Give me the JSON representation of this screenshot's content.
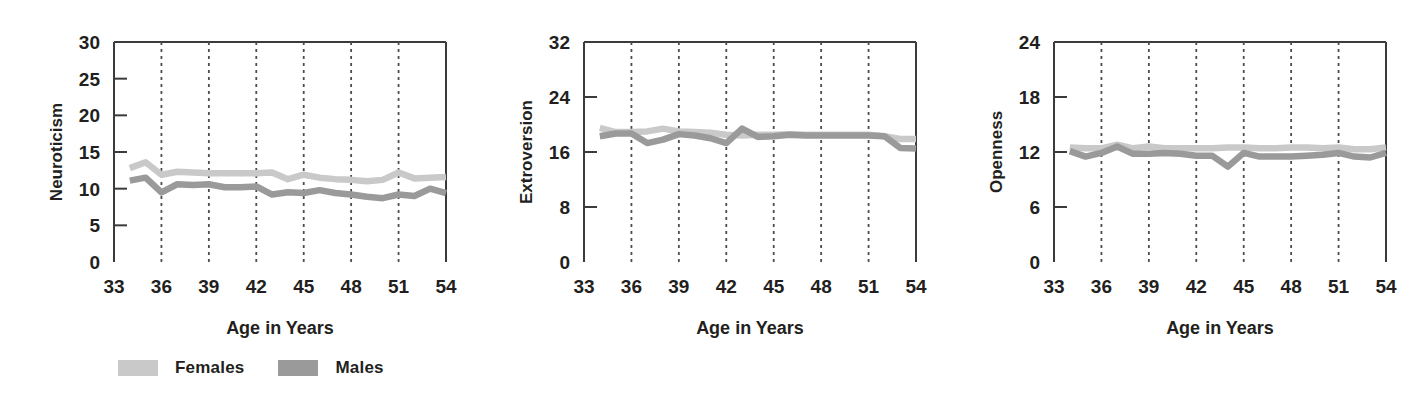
{
  "figure": {
    "series_colors": {
      "females": "#c9c9c9",
      "males": "#9a9a9a"
    },
    "axis_color": "#3b3b3b",
    "grid_color": "#4d4d4d"
  },
  "legend": {
    "entries": [
      {
        "label": "Females",
        "color": "#c9c9c9",
        "swatch_name": "legend-swatch-females"
      },
      {
        "label": "Males",
        "color": "#9a9a9a",
        "swatch_name": "legend-swatch-males"
      }
    ]
  },
  "chart_data": [
    {
      "type": "line",
      "title": "",
      "xlabel": "Age in Years",
      "ylabel": "Neuroticism",
      "xlim": [
        33,
        54
      ],
      "ylim": [
        0,
        30
      ],
      "xticks": [
        33,
        36,
        39,
        42,
        45,
        48,
        51,
        54
      ],
      "yticks": [
        0,
        5,
        10,
        15,
        20,
        25,
        30
      ],
      "grid": "vertical-dashed",
      "legend_position": "below-figure",
      "x": [
        34,
        35,
        36,
        37,
        38,
        39,
        40,
        41,
        42,
        43,
        44,
        45,
        46,
        47,
        48,
        49,
        50,
        51,
        52,
        53,
        54
      ],
      "series": [
        {
          "name": "Females",
          "color": "#c9c9c9",
          "values": [
            12.8,
            13.6,
            11.9,
            12.3,
            12.2,
            12.1,
            12.1,
            12.1,
            12.1,
            12.2,
            11.3,
            11.9,
            11.5,
            11.3,
            11.2,
            11.0,
            11.2,
            12.2,
            11.4,
            11.5,
            11.6
          ]
        },
        {
          "name": "Males",
          "color": "#9a9a9a",
          "values": [
            11.1,
            11.5,
            9.5,
            10.6,
            10.5,
            10.6,
            10.2,
            10.2,
            10.3,
            9.2,
            9.5,
            9.4,
            9.8,
            9.4,
            9.2,
            8.9,
            8.7,
            9.2,
            9.0,
            10.0,
            9.4
          ]
        }
      ]
    },
    {
      "type": "line",
      "title": "",
      "xlabel": "Age in Years",
      "ylabel": "Extroversion",
      "xlim": [
        33,
        54
      ],
      "ylim": [
        0,
        32
      ],
      "xticks": [
        33,
        36,
        39,
        42,
        45,
        48,
        51,
        54
      ],
      "yticks": [
        0,
        8,
        16,
        24,
        32
      ],
      "grid": "vertical-dashed",
      "legend_position": "below-figure",
      "x": [
        34,
        35,
        36,
        37,
        38,
        39,
        40,
        41,
        42,
        43,
        44,
        45,
        46,
        47,
        48,
        49,
        50,
        51,
        52,
        53,
        54
      ],
      "series": [
        {
          "name": "Females",
          "color": "#c9c9c9",
          "values": [
            19.5,
            18.9,
            18.9,
            19.0,
            19.4,
            19.0,
            18.9,
            18.8,
            18.5,
            18.4,
            18.5,
            18.5,
            18.6,
            18.5,
            18.5,
            18.5,
            18.5,
            18.5,
            18.3,
            17.9,
            17.9
          ]
        },
        {
          "name": "Males",
          "color": "#9a9a9a",
          "values": [
            18.3,
            18.7,
            18.7,
            17.3,
            17.8,
            18.6,
            18.4,
            18.0,
            17.3,
            19.4,
            18.2,
            18.3,
            18.5,
            18.4,
            18.4,
            18.4,
            18.4,
            18.4,
            18.3,
            16.6,
            16.5
          ]
        }
      ]
    },
    {
      "type": "line",
      "title": "",
      "xlabel": "Age in Years",
      "ylabel": "Openness",
      "xlim": [
        33,
        54
      ],
      "ylim": [
        0,
        24
      ],
      "xticks": [
        33,
        36,
        39,
        42,
        45,
        48,
        51,
        54
      ],
      "yticks": [
        0,
        6,
        12,
        18,
        24
      ],
      "grid": "vertical-dashed",
      "legend_position": "below-figure",
      "x": [
        34,
        35,
        36,
        37,
        38,
        39,
        40,
        41,
        42,
        43,
        44,
        45,
        46,
        47,
        48,
        49,
        50,
        51,
        52,
        53,
        54
      ],
      "series": [
        {
          "name": "Females",
          "color": "#c9c9c9",
          "values": [
            12.5,
            12.4,
            12.4,
            12.8,
            12.4,
            12.6,
            12.4,
            12.4,
            12.4,
            12.4,
            12.5,
            12.5,
            12.4,
            12.4,
            12.5,
            12.5,
            12.4,
            12.5,
            12.3,
            12.3,
            12.5
          ]
        },
        {
          "name": "Males",
          "color": "#9a9a9a",
          "values": [
            12.1,
            11.5,
            11.9,
            12.6,
            11.8,
            11.8,
            11.9,
            11.8,
            11.6,
            11.6,
            10.4,
            11.9,
            11.5,
            11.5,
            11.5,
            11.6,
            11.7,
            11.9,
            11.5,
            11.4,
            11.9
          ]
        }
      ]
    }
  ]
}
